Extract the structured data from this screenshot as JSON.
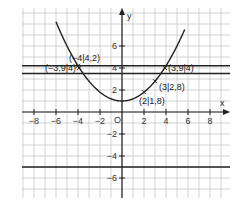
{
  "chart_data": {
    "type": "line",
    "title": "",
    "xlabel": "x",
    "ylabel": "y",
    "origin_label": "O",
    "xlim": [
      -9,
      9.5
    ],
    "ylim": [
      -7.5,
      9.5
    ],
    "grid": true,
    "x_ticks": [
      -8,
      -6,
      -4,
      -2,
      2,
      4,
      6,
      8
    ],
    "y_ticks": [
      -6,
      -4,
      -2,
      2,
      4,
      6
    ],
    "x_tick_labels": [
      "−8",
      "−6",
      "−4",
      "−2",
      "2",
      "4",
      "6",
      "8"
    ],
    "y_tick_labels": [
      "−6",
      "−4",
      "−2",
      "2",
      "4",
      "6"
    ],
    "series": [
      {
        "name": "parabola",
        "function": "y = 0.2x² + 1",
        "a": 0.2,
        "c": 1,
        "x_range": [
          -6,
          5.7
        ]
      },
      {
        "name": "horizontal-line-4.2",
        "function": "y = 4.2",
        "value": 4.2
      },
      {
        "name": "horizontal-line-3.5",
        "function": "y = 3.5",
        "value": 3.5
      },
      {
        "name": "horizontal-line-neg5",
        "function": "y = -5",
        "value": -5
      }
    ],
    "points": [
      {
        "x": -4,
        "y": 4.2,
        "label": "(−4|4,2)"
      },
      {
        "x": -3.9,
        "y": 4,
        "label": "(−3,9|4)"
      },
      {
        "x": 3.9,
        "y": 4,
        "label": "(3,9|4)"
      },
      {
        "x": 3,
        "y": 2.8,
        "label": "(3|2,8)"
      },
      {
        "x": 2,
        "y": 1.8,
        "label": "(2|1,8)"
      }
    ]
  }
}
